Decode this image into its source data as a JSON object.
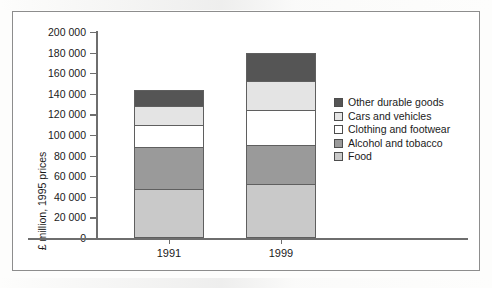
{
  "chart_data": {
    "type": "bar",
    "subtype": "stacked-vertical",
    "title": "",
    "xlabel": "",
    "ylabel": "£ million, 1995 prices",
    "categories": [
      "1991",
      "1999"
    ],
    "ylim": [
      0,
      200000
    ],
    "ytick_step": 20000,
    "ytick_labels": [
      "200 000",
      "180 000",
      "160 000",
      "140 000",
      "120 000",
      "100 000",
      "80 000",
      "60 000",
      "40 000",
      "20 000",
      "0"
    ],
    "ytick_values": [
      200000,
      180000,
      160000,
      140000,
      120000,
      100000,
      80000,
      60000,
      40000,
      20000,
      0
    ],
    "grid": false,
    "legend_position": "right",
    "stack_order_bottom_to_top": [
      "Food",
      "Alcohol and tobacco",
      "Clothing and footwear",
      "Cars and vehicles",
      "Other durable goods"
    ],
    "series": [
      {
        "name": "Food",
        "color": "#c9c9c9",
        "values": [
          48000,
          52000
        ]
      },
      {
        "name": "Alcohol and tobacco",
        "color": "#9a9a9a",
        "values": [
          40000,
          38000
        ]
      },
      {
        "name": "Clothing and footwear",
        "color": "#ffffff",
        "values": [
          22000,
          34000
        ]
      },
      {
        "name": "Cars and vehicles",
        "color": "#e4e4e4",
        "values": [
          18000,
          28000
        ]
      },
      {
        "name": "Other durable goods",
        "color": "#555555",
        "values": [
          16000,
          28000
        ]
      }
    ],
    "totals": [
      144000,
      180000
    ]
  },
  "legend": {
    "items": [
      {
        "label": "Other durable goods",
        "color": "#555555"
      },
      {
        "label": "Cars and vehicles",
        "color": "#e4e4e4"
      },
      {
        "label": "Clothing and footwear",
        "color": "#ffffff"
      },
      {
        "label": "Alcohol and tobacco",
        "color": "#9a9a9a"
      },
      {
        "label": "Food",
        "color": "#c9c9c9"
      }
    ]
  },
  "axis": {
    "y_title": "£ million, 1995 prices",
    "x_labels": [
      "1991",
      "1999"
    ]
  },
  "colors": {
    "frame": "#8d8d8d",
    "axis": "#6e6e6e",
    "bar_outline": "#5f5f5f",
    "text": "#1a1a1a",
    "background": "#ffffff"
  }
}
